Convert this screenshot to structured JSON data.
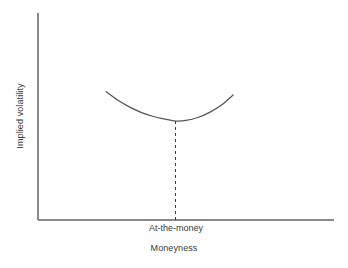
{
  "chart_data": {
    "type": "line",
    "title": "",
    "subtitle": "",
    "xlabel": "Moneyness",
    "ylabel": "Implied volatility",
    "grid": false,
    "legend": false,
    "legend_position": "none",
    "xlim": [
      0,
      1
    ],
    "ylim": [
      0,
      1
    ],
    "x_tick_labels": [
      "At-the-money"
    ],
    "y_tick_labels": [],
    "annotations": [
      {
        "name": "at-the-money-guide",
        "text": "At-the-money",
        "style": "dashed-vertical-line",
        "x": 0.466,
        "y_from": 0.478,
        "y_to": 0.0
      }
    ],
    "series": [
      {
        "name": "Implied volatility smile",
        "style": "solid-curve",
        "shape": "parabolic-smile",
        "x": [
          0.23,
          0.27,
          0.31,
          0.35,
          0.39,
          0.43,
          0.466,
          0.5,
          0.54,
          0.58,
          0.62,
          0.659
        ],
        "values": [
          0.62,
          0.578,
          0.545,
          0.519,
          0.5,
          0.487,
          0.478,
          0.481,
          0.495,
          0.52,
          0.555,
          0.604
        ]
      }
    ],
    "colors": {
      "background": "#ffffff",
      "curve": "#555555",
      "axis": "#8a8a8a",
      "dashed_guide": "#3b3b3b",
      "text": "#3b3b3b"
    }
  },
  "axes": {
    "x_title": "Moneyness",
    "y_title": "Implied volatility"
  },
  "labels": {
    "at_the_money": "At-the-money"
  }
}
